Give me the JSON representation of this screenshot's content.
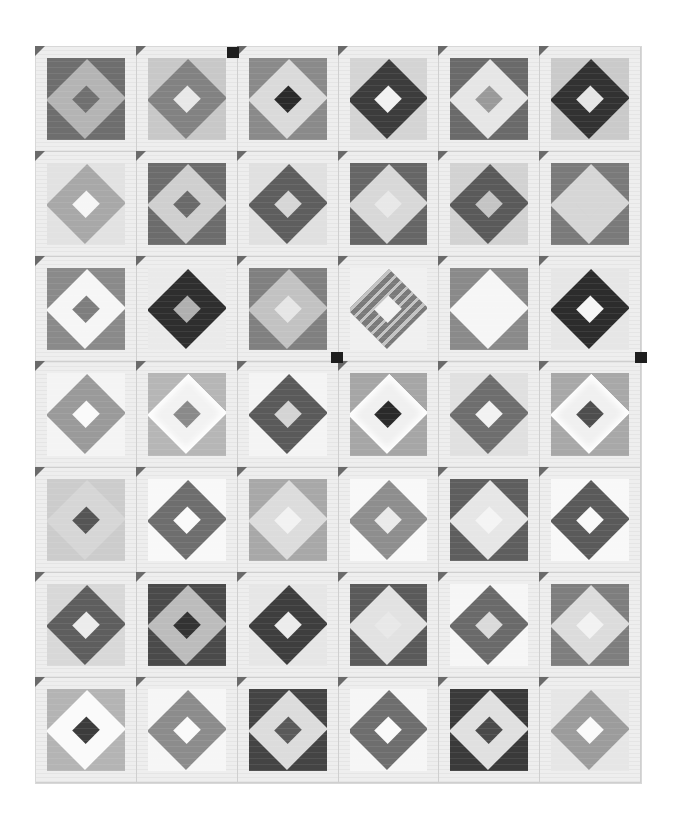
{
  "image": {
    "description": "Black-and-white photograph of a pieced quilt: 6 columns x 7 rows of square-in-a-square (diamond in square) blocks separated by light sashing strips with small dark corner triangles.",
    "grid": {
      "columns": 6,
      "rows": 7
    },
    "blocks": [
      [
        {
          "corner": "#6e6e6e",
          "diamond": "#b4b4b4",
          "center": "#707070"
        },
        {
          "corner": "#c8c8c8",
          "diamond": "#828282",
          "center": "#e8e8e8"
        },
        {
          "corner": "#8a8a8a",
          "diamond": "#dadada",
          "center": "#2a2a2a"
        },
        {
          "corner": "#d4d4d4",
          "diamond": "#3c3c3c",
          "center": "#f2f2f2"
        },
        {
          "corner": "#6a6a6a",
          "diamond": "#e6e6e6",
          "center": "#9a9a9a"
        },
        {
          "corner": "#cacaca",
          "diamond": "#323232",
          "center": "#e6e6e6"
        }
      ],
      [
        {
          "corner": "#e2e2e2",
          "diamond": "#a8a8a8",
          "center": "#f6f6f6"
        },
        {
          "corner": "#6c6c6c",
          "diamond": "#cfcfcf",
          "center": "#6a6a6a"
        },
        {
          "corner": "#e0e0e0",
          "diamond": "#5e5e5e",
          "center": "#d6d6d6"
        },
        {
          "corner": "#666666",
          "diamond": "#d8d8d8",
          "center": "#e8e8e8"
        },
        {
          "corner": "#d2d2d2",
          "diamond": "#5a5a5a",
          "center": "#c4c4c4"
        },
        {
          "corner": "#7a7a7a",
          "diamond": "#d6d6d6",
          "center": "#d6d6d6"
        }
      ],
      [
        {
          "corner": "#8a8a8a",
          "diamond": "#f6f6f6",
          "center": "#7e7e7e"
        },
        {
          "corner": "#eaeaea",
          "diamond": "#2e2e2e",
          "center": "#b0b0b0"
        },
        {
          "corner": "#808080",
          "diamond": "#c2c2c2",
          "center": "#e6e6e6"
        },
        {
          "corner": "#f0f0f0",
          "diamond": "#7a7a7a",
          "center": "#f2f2f2",
          "style": "striped"
        },
        {
          "corner": "#8a8a8a",
          "diamond": "#f6f6f6",
          "center": "#f6f6f6"
        },
        {
          "corner": "#e6e6e6",
          "diamond": "#2c2c2c",
          "center": "#f6f6f6"
        }
      ],
      [
        {
          "corner": "#f4f4f4",
          "diamond": "#9a9a9a",
          "center": "#fafafa"
        },
        {
          "corner": "#b6b6b6",
          "diamond": "#f2f2f2",
          "center": "#8a8a8a",
          "style": "feathered"
        },
        {
          "corner": "#f4f4f4",
          "diamond": "#5a5a5a",
          "center": "#d4d4d4"
        },
        {
          "corner": "#a6a6a6",
          "diamond": "#f0f0f0",
          "center": "#2a2a2a",
          "style": "feathered"
        },
        {
          "corner": "#e0e0e0",
          "diamond": "#6e6e6e",
          "center": "#f2f2f2"
        },
        {
          "corner": "#a8a8a8",
          "diamond": "#f0f0f0",
          "center": "#4e4e4e",
          "style": "feathered"
        }
      ],
      [
        {
          "corner": "#cccccc",
          "diamond": "#d6d6d6",
          "center": "#555555"
        },
        {
          "corner": "#f8f8f8",
          "diamond": "#6e6e6e",
          "center": "#fafafa"
        },
        {
          "corner": "#a8a8a8",
          "diamond": "#dcdcdc",
          "center": "#f2f2f2"
        },
        {
          "corner": "#f8f8f8",
          "diamond": "#8e8e8e",
          "center": "#eaeaea"
        },
        {
          "corner": "#5e5e5e",
          "diamond": "#e6e6e6",
          "center": "#f4f4f4"
        },
        {
          "corner": "#f8f8f8",
          "diamond": "#5a5a5a",
          "center": "#f8f8f8"
        }
      ],
      [
        {
          "corner": "#d8d8d8",
          "diamond": "#5e5e5e",
          "center": "#ececec"
        },
        {
          "corner": "#4a4a4a",
          "diamond": "#bcbcbc",
          "center": "#333333"
        },
        {
          "corner": "#e6e6e6",
          "diamond": "#3e3e3e",
          "center": "#ececec"
        },
        {
          "corner": "#5a5a5a",
          "diamond": "#e2e2e2",
          "center": "#e8e8e8"
        },
        {
          "corner": "#f6f6f6",
          "diamond": "#6a6a6a",
          "center": "#dadada"
        },
        {
          "corner": "#7e7e7e",
          "diamond": "#dcdcdc",
          "center": "#f2f2f2"
        }
      ],
      [
        {
          "corner": "#b4b4b4",
          "diamond": "#fafafa",
          "center": "#3c3c3c"
        },
        {
          "corner": "#f6f6f6",
          "diamond": "#8c8c8c",
          "center": "#fafafa"
        },
        {
          "corner": "#444444",
          "diamond": "#dcdcdc",
          "center": "#5a5a5a"
        },
        {
          "corner": "#f6f6f6",
          "diamond": "#6e6e6e",
          "center": "#fafafa"
        },
        {
          "corner": "#3a3a3a",
          "diamond": "#e0e0e0",
          "center": "#4a4a4a"
        },
        {
          "corner": "#e6e6e6",
          "diamond": "#9c9c9c",
          "center": "#fafafa"
        }
      ]
    ],
    "dark_posts": [
      {
        "x": 227,
        "y": 47
      },
      {
        "x": 331,
        "y": 352
      },
      {
        "x": 635,
        "y": 352
      }
    ]
  }
}
